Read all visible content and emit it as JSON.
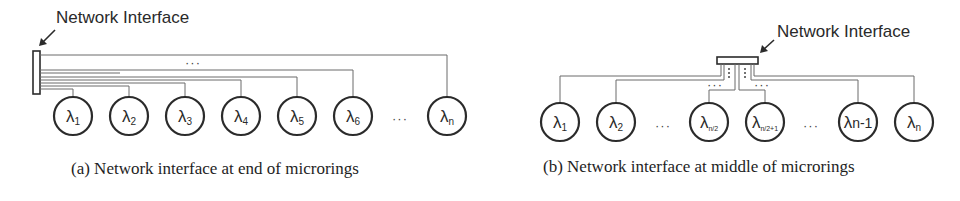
{
  "panel_a": {
    "ni_label": "Network Interface",
    "caption": "(a)  Network interface at end of microrings",
    "rings": [
      {
        "symbol": "λ",
        "sub": "1",
        "cx": 73
      },
      {
        "symbol": "λ",
        "sub": "2",
        "cx": 129
      },
      {
        "symbol": "λ",
        "sub": "3",
        "cx": 185
      },
      {
        "symbol": "λ",
        "sub": "4",
        "cx": 241
      },
      {
        "symbol": "λ",
        "sub": "5",
        "cx": 297
      },
      {
        "symbol": "λ",
        "sub": "6",
        "cx": 353
      },
      {
        "symbol": "λ",
        "sub": "n",
        "cx": 447
      }
    ],
    "ellipsis_between_rings": "···",
    "ellipsis_wires": "···"
  },
  "panel_b": {
    "ni_label": "Network Interface",
    "caption": "(b)  Network interface at middle of microrings",
    "rings": [
      {
        "symbol": "λ",
        "sub": "1",
        "cx": 80
      },
      {
        "symbol": "λ",
        "sub": "2",
        "cx": 136
      },
      {
        "symbol": "λ",
        "sub": "n/2",
        "cx": 229
      },
      {
        "symbol": "λ",
        "sub": "n/2+1",
        "cx": 285
      },
      {
        "symbol": "λ",
        "sub": "n-1",
        "cx": 378
      },
      {
        "symbol": "λ",
        "sub": "n",
        "cx": 434
      }
    ],
    "ellipsis_left": "···",
    "ellipsis_right": "···",
    "ellipsis_wires_left": "···",
    "ellipsis_wires_right": "···"
  },
  "colors": {
    "ring_stroke": "#2b2b2b",
    "wire": "#6a6a6a",
    "text": "#222222"
  }
}
